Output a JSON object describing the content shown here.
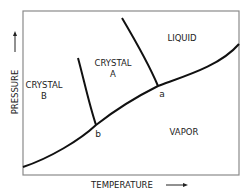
{
  "diagram": {
    "type": "phase-diagram",
    "axes": {
      "x_label": "TEMPERATURE",
      "y_label": "PRESSURE",
      "x_arrow": "→",
      "y_arrow": "↑"
    },
    "regions": {
      "crystal_b_line1": "CRYSTAL",
      "crystal_b_line2": "B",
      "crystal_a_line1": "CRYSTAL",
      "crystal_a_line2": "A",
      "liquid": "LIQUID",
      "vapor": "VAPOR"
    },
    "points": {
      "a": "a",
      "b": "b"
    },
    "colors": {
      "line": "#111111",
      "frame": "#888888",
      "text": "#222222"
    }
  }
}
